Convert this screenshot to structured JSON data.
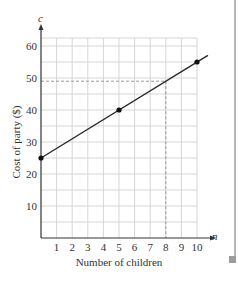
{
  "chart_data": {
    "type": "line",
    "title": "",
    "xlabel": "Number of children",
    "ylabel": "Cost of party ($)",
    "x_axis_var": "n",
    "y_axis_var": "c",
    "xlim": [
      0,
      10.8
    ],
    "ylim": [
      0,
      63
    ],
    "x_ticks": [
      1,
      2,
      3,
      4,
      5,
      6,
      7,
      8,
      9,
      10
    ],
    "y_ticks": [
      10,
      20,
      30,
      40,
      50,
      60
    ],
    "grid": true,
    "grid_step_x": 1,
    "grid_step_y": 5,
    "series": [
      {
        "name": "cost",
        "x": [
          0,
          5,
          10
        ],
        "y": [
          25,
          40,
          55
        ],
        "markers": true,
        "line_extends_to_x": 10.7
      }
    ],
    "annotations": [
      {
        "type": "dashed-guide",
        "x": 8,
        "y": 49,
        "description": "dashed lines from y=49 on axis to x=8 and down to x-axis"
      }
    ],
    "colors": {
      "line": "#2a2a2a",
      "grid": "#d6d6d6",
      "dashed": "#9a9a9a",
      "axis": "#333333",
      "text": "#333333"
    }
  }
}
